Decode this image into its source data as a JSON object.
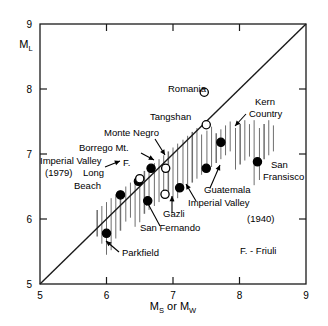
{
  "chart_data": {
    "type": "scatter",
    "title": "",
    "xlabel": "M_S or M_W",
    "ylabel": "M_L",
    "xlabel_parts": {
      "pre": "M",
      "sub1": "S",
      "mid": " or M",
      "sub2": "W"
    },
    "ylabel_parts": {
      "pre": "M",
      "sub": "L"
    },
    "xlim": [
      5,
      9
    ],
    "ylim": [
      5,
      9
    ],
    "xticks": [
      5,
      6,
      7,
      8,
      9
    ],
    "yticks": [
      5,
      6,
      7,
      8,
      9
    ],
    "xtick_labels": [
      "5",
      "6",
      "7",
      "8",
      "9"
    ],
    "ytick_labels": [
      "5",
      "6",
      "7",
      "8",
      "9"
    ],
    "grid": false,
    "legend_position": "none",
    "reference_line": {
      "name": "one-to-one-line",
      "from": [
        5,
        5
      ],
      "to": [
        9,
        9
      ]
    },
    "marker_types": {
      "filled": "solid black circle",
      "open": "hollow circle"
    },
    "points": [
      {
        "label": "Romania",
        "x": 7.47,
        "y": 7.95,
        "marker": "open"
      },
      {
        "label": "Tangshan",
        "x": 7.5,
        "y": 7.45,
        "marker": "open"
      },
      {
        "label": "Kern Country",
        "x": 7.72,
        "y": 7.18,
        "marker": "filled"
      },
      {
        "label": "San Fransisco",
        "x": 8.27,
        "y": 6.88,
        "marker": "filled"
      },
      {
        "label": "Monte Negro",
        "x": 6.89,
        "y": 6.78,
        "marker": "open"
      },
      {
        "label": "Borrego Mt.",
        "x": 6.67,
        "y": 6.78,
        "marker": "filled"
      },
      {
        "label": "Guatemala",
        "x": 7.5,
        "y": 6.78,
        "marker": "filled"
      },
      {
        "label": "Imperial Valley (1979)",
        "x": 6.48,
        "y": 6.58,
        "marker": "filled"
      },
      {
        "label": "F.",
        "x": 6.5,
        "y": 6.62,
        "marker": "open"
      },
      {
        "label": "Imperial Valley (1940)",
        "x": 7.1,
        "y": 6.48,
        "marker": "filled"
      },
      {
        "label": "Long Beach",
        "x": 6.21,
        "y": 6.37,
        "marker": "filled"
      },
      {
        "label": "Gazli",
        "x": 6.88,
        "y": 6.38,
        "marker": "open"
      },
      {
        "label": "San Fernando",
        "x": 6.62,
        "y": 6.28,
        "marker": "filled"
      },
      {
        "label": "Parkfield",
        "x": 6.0,
        "y": 5.78,
        "marker": "filled"
      }
    ],
    "hatch_bars": [
      {
        "x": 5.86,
        "y_top": 6.14,
        "y_bottom": 5.73
      },
      {
        "x": 5.93,
        "y_top": 6.2,
        "y_bottom": 5.62
      },
      {
        "x": 6.0,
        "y_top": 6.26,
        "y_bottom": 5.45
      },
      {
        "x": 6.07,
        "y_top": 6.32,
        "y_bottom": 5.52
      },
      {
        "x": 6.14,
        "y_top": 6.38,
        "y_bottom": 5.7
      },
      {
        "x": 6.21,
        "y_top": 6.44,
        "y_bottom": 5.82
      },
      {
        "x": 6.29,
        "y_top": 6.5,
        "y_bottom": 5.96
      },
      {
        "x": 6.36,
        "y_top": 6.56,
        "y_bottom": 6.02
      },
      {
        "x": 6.43,
        "y_top": 6.62,
        "y_bottom": 5.88
      },
      {
        "x": 6.5,
        "y_top": 6.68,
        "y_bottom": 5.95
      },
      {
        "x": 6.57,
        "y_top": 6.74,
        "y_bottom": 6.08
      },
      {
        "x": 6.64,
        "y_top": 6.8,
        "y_bottom": 6.14
      },
      {
        "x": 6.72,
        "y_top": 6.86,
        "y_bottom": 6.2
      },
      {
        "x": 6.79,
        "y_top": 6.92,
        "y_bottom": 6.26
      },
      {
        "x": 6.86,
        "y_top": 6.98,
        "y_bottom": 6.32
      },
      {
        "x": 6.93,
        "y_top": 7.04,
        "y_bottom": 6.38
      },
      {
        "x": 7.0,
        "y_top": 7.1,
        "y_bottom": 6.26
      },
      {
        "x": 7.07,
        "y_top": 7.16,
        "y_bottom": 6.32
      },
      {
        "x": 7.15,
        "y_top": 7.22,
        "y_bottom": 6.44
      },
      {
        "x": 7.22,
        "y_top": 7.28,
        "y_bottom": 6.5
      },
      {
        "x": 7.29,
        "y_top": 7.34,
        "y_bottom": 6.56
      },
      {
        "x": 7.36,
        "y_top": 7.4,
        "y_bottom": 6.62
      },
      {
        "x": 7.43,
        "y_top": 7.3,
        "y_bottom": 6.68
      },
      {
        "x": 7.51,
        "y_top": 7.36,
        "y_bottom": 6.74
      },
      {
        "x": 7.58,
        "y_top": 7.42,
        "y_bottom": 6.8
      },
      {
        "x": 7.65,
        "y_top": 7.32,
        "y_bottom": 6.86
      },
      {
        "x": 7.72,
        "y_top": 7.38,
        "y_bottom": 6.92
      },
      {
        "x": 7.79,
        "y_top": 7.44,
        "y_bottom": 6.98
      },
      {
        "x": 7.86,
        "y_top": 7.5,
        "y_bottom": 7.04
      },
      {
        "x": 7.94,
        "y_top": 7.4,
        "y_bottom": 6.76
      },
      {
        "x": 8.01,
        "y_top": 7.46,
        "y_bottom": 6.84
      },
      {
        "x": 8.08,
        "y_top": 7.52,
        "y_bottom": 6.9
      },
      {
        "x": 8.15,
        "y_top": 7.46,
        "y_bottom": 6.96
      },
      {
        "x": 8.22,
        "y_top": 7.52,
        "y_bottom": 6.52
      },
      {
        "x": 8.3,
        "y_top": 7.4,
        "y_bottom": 6.6
      },
      {
        "x": 8.37,
        "y_top": 7.46,
        "y_bottom": 6.92
      },
      {
        "x": 8.44,
        "y_top": 7.52,
        "y_bottom": 6.98
      },
      {
        "x": 8.51,
        "y_top": 7.44,
        "y_bottom": 7.04
      }
    ],
    "annotations": [
      {
        "name": "romania-label",
        "text": "Romania",
        "x": 168,
        "y": 92,
        "anchor": "start"
      },
      {
        "name": "tangshan-label",
        "text": "Tangshan",
        "x": 150,
        "y": 120,
        "anchor": "start"
      },
      {
        "name": "kern-country-line1",
        "text": "Kern",
        "x": 255,
        "y": 105,
        "anchor": "start"
      },
      {
        "name": "kern-country-line2",
        "text": "Country",
        "x": 249,
        "y": 117,
        "anchor": "start"
      },
      {
        "name": "monte-negro-label",
        "text": "Monte Negro",
        "x": 104,
        "y": 136,
        "anchor": "start"
      },
      {
        "name": "borrego-mt-label",
        "text": "Borrego Mt.",
        "x": 79,
        "y": 151,
        "anchor": "start"
      },
      {
        "name": "imperial-valley-1979",
        "text": "Imperial Valley",
        "x": 40,
        "y": 164,
        "anchor": "start"
      },
      {
        "name": "imperial-valley-1979-yr",
        "text": "(1979)",
        "x": 45,
        "y": 176,
        "anchor": "start"
      },
      {
        "name": "f-label",
        "text": "F.",
        "x": 123,
        "y": 166,
        "anchor": "start"
      },
      {
        "name": "long-label",
        "text": "Long",
        "x": 83,
        "y": 176,
        "anchor": "start"
      },
      {
        "name": "beach-label",
        "text": "Beach",
        "x": 74,
        "y": 189,
        "anchor": "start"
      },
      {
        "name": "san-fransisco-line1",
        "text": "San",
        "x": 271,
        "y": 168,
        "anchor": "start"
      },
      {
        "name": "san-fransisco-line2",
        "text": "Fransisco",
        "x": 263,
        "y": 180,
        "anchor": "start"
      },
      {
        "name": "guatemala-label",
        "text": "Guatemala",
        "x": 204,
        "y": 193,
        "anchor": "start"
      },
      {
        "name": "imperial-valley-1940",
        "text": "Imperial Valley",
        "x": 188,
        "y": 206,
        "anchor": "start"
      },
      {
        "name": "imperial-valley-1940-yr",
        "text": "(1940)",
        "x": 247,
        "y": 222,
        "anchor": "start"
      },
      {
        "name": "gazli-label",
        "text": "Gazli",
        "x": 163,
        "y": 217,
        "anchor": "start"
      },
      {
        "name": "san-fernando-label",
        "text": "San Fernando",
        "x": 140,
        "y": 231,
        "anchor": "start"
      },
      {
        "name": "parkfield-label",
        "text": "Parkfield",
        "x": 122,
        "y": 256,
        "anchor": "start"
      },
      {
        "name": "friuli-note",
        "text": "F. - Friuli",
        "x": 240,
        "y": 254,
        "anchor": "start"
      }
    ],
    "leader_lines": [
      {
        "name": "kern-country-leader",
        "x1": 246,
        "y1": 114,
        "x2": 235,
        "y2": 126
      },
      {
        "name": "monte-negro-leader",
        "x1": 155,
        "y1": 139,
        "x2": 165,
        "y2": 155
      },
      {
        "name": "borrego-mt-leader",
        "x1": 141,
        "y1": 153,
        "x2": 154,
        "y2": 160
      },
      {
        "name": "imperial-valley-1979-leader",
        "x1": 105,
        "y1": 167,
        "x2": 120,
        "y2": 161
      },
      {
        "name": "guatemala-leader",
        "x1": 210,
        "y1": 188,
        "x2": 220,
        "y2": 165
      },
      {
        "name": "imperial-valley-1940-leader",
        "x1": 196,
        "y1": 201,
        "x2": 186,
        "y2": 184
      },
      {
        "name": "gazli-leader",
        "x1": 172,
        "y1": 213,
        "x2": 172,
        "y2": 196
      },
      {
        "name": "san-fernando-leader",
        "x1": 160,
        "y1": 226,
        "x2": 146,
        "y2": 200
      },
      {
        "name": "parkfield-leader",
        "x1": 119,
        "y1": 252,
        "x2": 106,
        "y2": 241
      }
    ]
  }
}
